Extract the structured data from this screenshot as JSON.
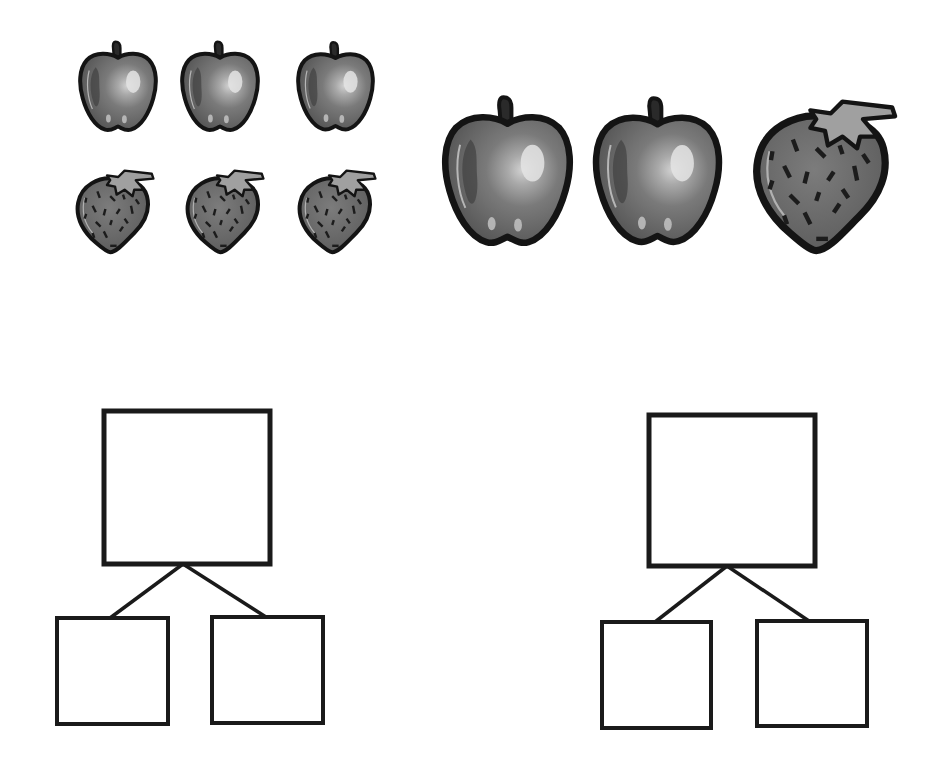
{
  "worksheet": {
    "title": "Part-whole number bond worksheet",
    "background": "#ffffff",
    "stroke_color": "#1a1a1a"
  },
  "groups": [
    {
      "id": "left-group",
      "description": "3 apples and 3 strawberries",
      "fruits": [
        {
          "type": "apple",
          "size": "small",
          "x": 78,
          "y": 38,
          "w": 80,
          "h": 97
        },
        {
          "type": "apple",
          "size": "small",
          "x": 180,
          "y": 38,
          "w": 80,
          "h": 97
        },
        {
          "type": "apple",
          "size": "small",
          "x": 296,
          "y": 38,
          "w": 79,
          "h": 97
        },
        {
          "type": "strawberry",
          "size": "small",
          "x": 75,
          "y": 165,
          "w": 80,
          "h": 96
        },
        {
          "type": "strawberry",
          "size": "small",
          "x": 185,
          "y": 165,
          "w": 80,
          "h": 96
        },
        {
          "type": "strawberry",
          "size": "small",
          "x": 297,
          "y": 165,
          "w": 80,
          "h": 96
        }
      ],
      "counts": {
        "apple": 3,
        "strawberry": 3,
        "total": 6
      }
    },
    {
      "id": "right-group",
      "description": "2 apples and 1 strawberry",
      "fruits": [
        {
          "type": "apple",
          "size": "large",
          "x": 441,
          "y": 92,
          "w": 133,
          "h": 158
        },
        {
          "type": "apple",
          "size": "large",
          "x": 592,
          "y": 93,
          "w": 131,
          "h": 156
        },
        {
          "type": "strawberry",
          "size": "large",
          "x": 752,
          "y": 97,
          "w": 146,
          "h": 164
        }
      ],
      "counts": {
        "apple": 2,
        "strawberry": 1,
        "total": 3
      }
    }
  ],
  "number_bonds": [
    {
      "id": "left-bond",
      "whole": {
        "x": 104,
        "y": 411,
        "w": 166,
        "h": 153,
        "value": ""
      },
      "parts": [
        {
          "x": 57,
          "y": 618,
          "w": 111,
          "h": 106,
          "value": ""
        },
        {
          "x": 212,
          "y": 617,
          "w": 111,
          "h": 106,
          "value": ""
        }
      ],
      "connector": {
        "apex": [
          183,
          564
        ],
        "left_end": [
          110,
          618
        ],
        "right_end": [
          266,
          617
        ]
      }
    },
    {
      "id": "right-bond",
      "whole": {
        "x": 649,
        "y": 415,
        "w": 166,
        "h": 151,
        "value": ""
      },
      "parts": [
        {
          "x": 602,
          "y": 622,
          "w": 109,
          "h": 106,
          "value": ""
        },
        {
          "x": 757,
          "y": 621,
          "w": 110,
          "h": 105,
          "value": ""
        }
      ],
      "connector": {
        "apex": [
          727,
          566
        ],
        "left_end": [
          655,
          622
        ],
        "right_end": [
          809,
          621
        ]
      }
    }
  ],
  "icons": {
    "apple": "apple-icon",
    "strawberry": "strawberry-icon"
  },
  "colors": {
    "apple_body": "#6e6e6e",
    "apple_shadow": "#4a4a4a",
    "apple_highlight": "#bdbdbd",
    "strawberry_body": "#6a6a6a",
    "strawberry_leaf": "#9a9a9a",
    "outline": "#141414"
  }
}
